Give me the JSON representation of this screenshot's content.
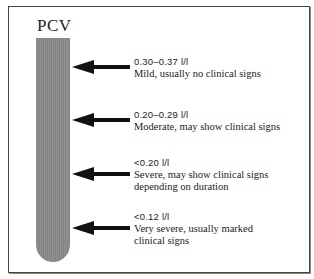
{
  "diagram": {
    "title": "PCV",
    "tube_color": "#8a8a8a",
    "arrow_color": "#111111",
    "levels": [
      {
        "range": "0.30–0.37 l/l",
        "description": "Mild, usually no clinical signs"
      },
      {
        "range": "0.20–0.29 l/l",
        "description": "Moderate, may show clinical signs"
      },
      {
        "range": "<0.20 l/l",
        "description": "Severe, may show clinical signs depending on duration"
      },
      {
        "range": "<0.12 l/l",
        "description": "Very severe, usually marked clinical signs"
      }
    ]
  }
}
